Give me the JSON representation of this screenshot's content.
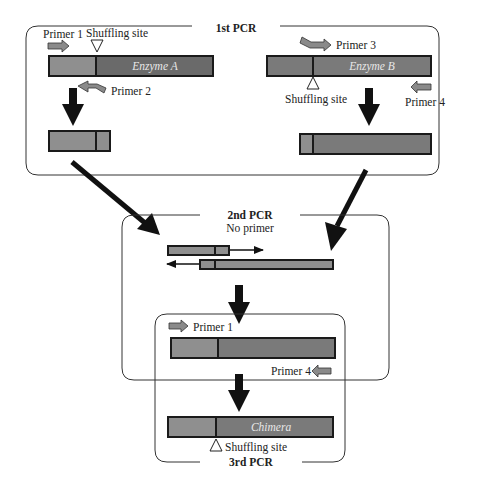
{
  "colors": {
    "light_segment": "#8f8f8f",
    "dark_segment": "#6a6a6a",
    "outline": "#1a1a1a",
    "primer": "#8a8a8a",
    "arrow": "#111111",
    "box": "#333333"
  },
  "stage1": {
    "label": "1st PCR",
    "enzyme_a": {
      "name": "Enzyme A",
      "primer_forward": "Primer 1",
      "primer_reverse": "Primer 2",
      "site_label": "Shuffling site"
    },
    "enzyme_b": {
      "name": "Enzyme B",
      "primer_forward": "Primer 3",
      "primer_reverse": "Primer 4",
      "site_label": "Shuffling site"
    }
  },
  "stage2": {
    "label": "2nd PCR",
    "sublabel": "No primer"
  },
  "stage3": {
    "label": "3rd PCR",
    "primer_forward": "Primer 1",
    "primer_reverse": "Primer 4",
    "product": "Chimera",
    "site_label": "Shuffling site"
  }
}
